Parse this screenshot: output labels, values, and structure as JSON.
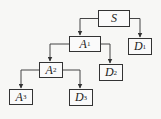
{
  "diagram": {
    "type": "tree",
    "nodes": [
      {
        "id": "S",
        "label": "S",
        "sub": "",
        "x": 98,
        "y": 10,
        "w": 32,
        "h": 17
      },
      {
        "id": "A1",
        "label": "A",
        "sub": "1",
        "x": 69,
        "y": 36,
        "w": 32,
        "h": 16
      },
      {
        "id": "D1",
        "label": "D",
        "sub": "1",
        "x": 128,
        "y": 38,
        "w": 24,
        "h": 17
      },
      {
        "id": "A2",
        "label": "A",
        "sub": "2",
        "x": 39,
        "y": 62,
        "w": 24,
        "h": 16
      },
      {
        "id": "D2",
        "label": "D",
        "sub": "2",
        "x": 99,
        "y": 64,
        "w": 24,
        "h": 17
      },
      {
        "id": "A3",
        "label": "A",
        "sub": "3",
        "x": 9,
        "y": 89,
        "w": 24,
        "h": 16
      },
      {
        "id": "D3",
        "label": "D",
        "sub": "3",
        "x": 69,
        "y": 89,
        "w": 24,
        "h": 17
      }
    ],
    "edges": [
      {
        "from": "S",
        "to": "A1"
      },
      {
        "from": "S",
        "to": "D1"
      },
      {
        "from": "A1",
        "to": "A2"
      },
      {
        "from": "A1",
        "to": "D2"
      },
      {
        "from": "A2",
        "to": "A3"
      },
      {
        "from": "A2",
        "to": "D3"
      }
    ]
  }
}
